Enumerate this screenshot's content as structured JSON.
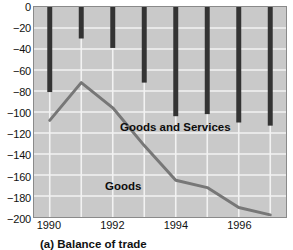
{
  "figure": {
    "caption": "(a) Balance of trade"
  },
  "chart_data": {
    "type": "bar",
    "title": "(a) Balance of trade",
    "xlabel": "",
    "ylabel": "",
    "x": [
      1990,
      1991,
      1992,
      1993,
      1994,
      1995,
      1996,
      1997
    ],
    "categories": [
      "1990",
      "1991",
      "1992",
      "1993",
      "1994",
      "1995",
      "1996",
      "1997"
    ],
    "xtick_labels": [
      "1990",
      "1992",
      "1994",
      "1996"
    ],
    "xtick_values": [
      1990,
      1992,
      1994,
      1996
    ],
    "ylim": [
      -200,
      0
    ],
    "yticks": [
      0,
      -20,
      -40,
      -60,
      -80,
      -100,
      -120,
      -140,
      -160,
      -180,
      -200
    ],
    "ytick_labels": [
      "0",
      "−20",
      "−40",
      "−60",
      "−80",
      "−100",
      "−120",
      "−140",
      "−160",
      "−180",
      "−200"
    ],
    "grid": true,
    "legend": "inline-annotations",
    "series": [
      {
        "name": "Goods and Services",
        "type": "bar",
        "color": "#333333",
        "values": [
          -81,
          -30,
          -39,
          -72,
          -104,
          -102,
          -110,
          -113
        ]
      },
      {
        "name": "Goods",
        "type": "line",
        "color": "#777777",
        "values": [
          -108,
          -72,
          -96,
          -132,
          -165,
          -172,
          -191,
          -198
        ]
      }
    ],
    "annotations": [
      {
        "text": "Goods and Services",
        "x": 1994,
        "y": -120
      },
      {
        "text": "Goods",
        "x": 1993,
        "y": -176
      }
    ],
    "colors": {
      "plot_background": "#c9c9c9",
      "grid": "#f2f2f2",
      "bar": "#333333",
      "line": "#777777",
      "axis": "#8a8a8a",
      "text": "#111111"
    }
  }
}
